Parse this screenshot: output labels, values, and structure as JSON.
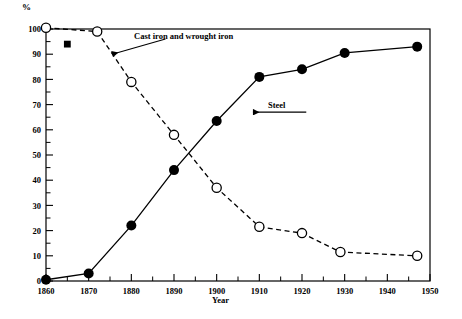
{
  "chart_data": {
    "type": "line",
    "title": "",
    "xlabel": "Year",
    "ylabel": "%",
    "ylim": [
      0,
      100
    ],
    "xlim": [
      1860,
      1950
    ],
    "grid": false,
    "legend_position": "inline-annotations",
    "y_ticks": [
      0,
      10,
      20,
      30,
      40,
      50,
      60,
      70,
      80,
      90,
      100
    ],
    "y_tick_labels": [
      "0",
      "10",
      "20",
      "30",
      "40",
      "50",
      "60",
      "70",
      "80",
      "90",
      "100"
    ],
    "y_minor_ticks": [
      5,
      15,
      25,
      35,
      45,
      55,
      65,
      75,
      85,
      95
    ],
    "x_ticks": [
      1860,
      1870,
      1880,
      1890,
      1900,
      1910,
      1920,
      1930,
      1940,
      1950
    ],
    "x_tick_labels": [
      "1860",
      "1870",
      "1880",
      "1890",
      "1900",
      "1910",
      "1920",
      "1930",
      "1940",
      "1950"
    ],
    "x_minor_ticks": [
      1865,
      1875,
      1885,
      1895,
      1905,
      1915,
      1925,
      1935,
      1945
    ],
    "series": [
      {
        "name": "Steel",
        "marker": "filled-circle",
        "line": "solid",
        "color": "#000000",
        "x": [
          1860,
          1870,
          1880,
          1890,
          1900,
          1910,
          1920,
          1930,
          1947
        ],
        "values": [
          0.5,
          3,
          22,
          44,
          63.5,
          81,
          84,
          90.5,
          93
        ]
      },
      {
        "name": "Cast iron and wrought iron",
        "marker": "open-circle",
        "line": "dashed",
        "color": "#000000",
        "x": [
          1860,
          1872,
          1880,
          1890,
          1900,
          1910,
          1920,
          1929,
          1947
        ],
        "values": [
          100.5,
          99,
          79,
          58,
          37,
          21.5,
          19,
          11.5,
          10
        ]
      }
    ],
    "extra_markers": [
      {
        "name": "square-marker",
        "marker": "filled-square",
        "x": 1865,
        "y": 94
      }
    ],
    "annotations": [
      {
        "id": "cast-iron-label",
        "text": "Cast iron and wrought iron",
        "arrow_from": [
          1888,
          96
        ],
        "arrow_to": [
          1875.5,
          90
        ]
      },
      {
        "id": "steel-label",
        "text": "Steel",
        "arrow_from": [
          1921,
          67
        ],
        "arrow_to": [
          1908.5,
          67
        ]
      }
    ]
  },
  "labels": {
    "percent": "%",
    "year": "Year",
    "cast_iron": "Cast iron and wrought iron",
    "steel": "Steel"
  }
}
